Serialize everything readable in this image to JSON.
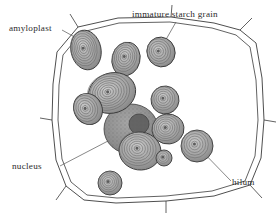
{
  "figure": {
    "kind": "botanical-illustration",
    "width": 280,
    "height": 217,
    "background_color": "#ffffff",
    "ink_color": "#3a3a3a",
    "grain_fill_color": "#9a9a9a",
    "grain_ring_color": "#6b6b6b",
    "nucleus_fill_color": "#8c8c8c",
    "nucleolus_color": "#5e5e5e"
  },
  "labels": [
    {
      "id": "amyloplast",
      "text": "amyloplast",
      "leader_from": [
        62,
        30
      ],
      "leader_to": [
        80,
        40
      ]
    },
    {
      "id": "immature-starch-grain",
      "text": "immature starch grain",
      "leader_from": [
        176,
        22
      ],
      "leader_to": [
        160,
        50
      ]
    },
    {
      "id": "nucleus",
      "text": "nucleus",
      "leader_from": [
        60,
        166
      ],
      "leader_to": [
        131,
        129
      ]
    },
    {
      "id": "hilum",
      "text": "hilum",
      "leader_from": [
        231,
        181
      ],
      "leader_to": [
        197,
        146
      ]
    }
  ],
  "cell_wall": {
    "outer_points": "57,52 78,27 118,18 171,17 214,23 240,30 256,43 262,78 264,120 261,158 250,185 214,196 166,201 116,203 84,200 66,186 56,160 52,120 53,84",
    "inner_points": "63,55 82,32 119,23 170,22 212,28 236,35 250,47 256,80 258,120 255,156 245,181 212,191 166,196 117,198 87,195 71,182 62,159 58,120 59,85",
    "corner_spurs": [
      [
        78,
        27,
        70,
        14
      ],
      [
        240,
        30,
        252,
        18
      ],
      [
        250,
        185,
        262,
        198
      ],
      [
        66,
        186,
        56,
        200
      ],
      [
        52,
        120,
        40,
        118
      ],
      [
        264,
        120,
        276,
        122
      ],
      [
        171,
        17,
        172,
        5
      ],
      [
        166,
        201,
        166,
        213
      ]
    ]
  },
  "nucleus_body": {
    "cx": 131,
    "cy": 129,
    "rx": 27,
    "ry": 25,
    "nucleolus": {
      "cx": 139,
      "cy": 124,
      "r": 10
    }
  },
  "starch_grains": [
    {
      "id": "grain-amyloplast",
      "cx": 86,
      "cy": 50,
      "rx": 15,
      "ry": 20,
      "rot": -12,
      "rings": 7
    },
    {
      "id": "grain-immature",
      "cx": 161,
      "cy": 52,
      "rx": 14,
      "ry": 15,
      "rot": -20,
      "rings": 5
    },
    {
      "id": "grain-upper-mid",
      "cx": 126,
      "cy": 59,
      "rx": 14,
      "ry": 17,
      "rot": 14,
      "rings": 6
    },
    {
      "id": "grain-large-left",
      "cx": 112,
      "cy": 93,
      "rx": 24,
      "ry": 20,
      "rot": -18,
      "rings": 8
    },
    {
      "id": "grain-left-small",
      "cx": 88,
      "cy": 109,
      "rx": 14,
      "ry": 16,
      "rot": -28,
      "rings": 5
    },
    {
      "id": "grain-right-upper",
      "cx": 165,
      "cy": 100,
      "rx": 14,
      "ry": 14,
      "rot": 5,
      "rings": 5
    },
    {
      "id": "grain-right-mid",
      "cx": 168,
      "cy": 129,
      "rx": 16,
      "ry": 15,
      "rot": -6,
      "rings": 6
    },
    {
      "id": "grain-center-low",
      "cx": 140,
      "cy": 151,
      "rx": 21,
      "ry": 19,
      "rot": 8,
      "rings": 7
    },
    {
      "id": "grain-tiny-mid",
      "cx": 164,
      "cy": 158,
      "rx": 8,
      "ry": 8,
      "rot": 0,
      "rings": 3
    },
    {
      "id": "grain-hilum",
      "cx": 197,
      "cy": 146,
      "rx": 16,
      "ry": 16,
      "rot": 0,
      "rings": 5
    },
    {
      "id": "grain-bottom",
      "cx": 110,
      "cy": 183,
      "rx": 12,
      "ry": 12,
      "rot": 0,
      "rings": 5
    }
  ]
}
